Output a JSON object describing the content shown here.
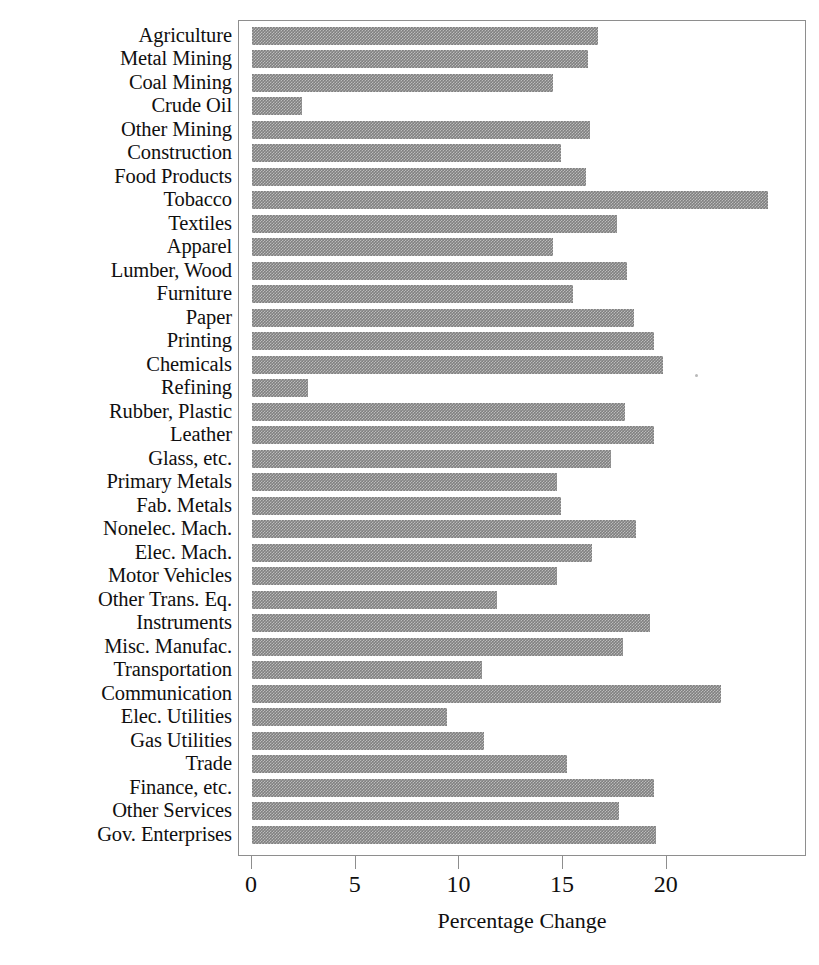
{
  "chart_data": {
    "type": "bar",
    "orientation": "horizontal",
    "title": "",
    "xlabel": "Percentage Change",
    "ylabel": "",
    "xlim": [
      0,
      27.4
    ],
    "xticks": [
      0,
      5,
      10,
      15,
      20
    ],
    "xtick_labels": [
      "0",
      "5",
      "10",
      "15",
      "20"
    ],
    "grid": false,
    "legend": null,
    "bar_color": "#808080",
    "axis_color": "#8e8e8e",
    "categories": [
      "Agriculture",
      "Metal Mining",
      "Coal Mining",
      "Crude Oil",
      "Other Mining",
      "Construction",
      "Food Products",
      "Tobacco",
      "Textiles",
      "Apparel",
      "Lumber, Wood",
      "Furniture",
      "Paper",
      "Printing",
      "Chemicals",
      "Refining",
      "Rubber, Plastic",
      "Leather",
      "Glass, etc.",
      "Primary Metals",
      "Fab. Metals",
      "Nonelec. Mach.",
      "Elec. Mach.",
      "Motor Vehicles",
      "Other Trans. Eq.",
      "Instruments",
      "Misc. Manufac.",
      "Transportation",
      "Communication",
      "Elec. Utilities",
      "Gas Utilities",
      "Trade",
      "Finance, etc.",
      "Other Services",
      "Gov. Enterprises"
    ],
    "values": [
      16.7,
      16.2,
      14.5,
      2.4,
      16.3,
      14.9,
      16.1,
      24.9,
      17.6,
      14.5,
      18.1,
      15.5,
      18.4,
      19.4,
      19.8,
      2.7,
      18.0,
      19.4,
      17.3,
      14.7,
      14.9,
      18.5,
      16.4,
      14.7,
      11.8,
      19.2,
      17.9,
      11.1,
      22.6,
      9.4,
      11.2,
      15.2,
      19.4,
      17.7,
      19.5
    ]
  }
}
